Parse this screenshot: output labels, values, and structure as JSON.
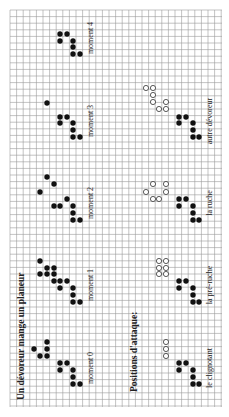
{
  "title": "Un dévoreur mange un planeur",
  "section2_title": "Positions d'attaque:",
  "grid": {
    "x0": 10,
    "y0": 10,
    "x1": 222,
    "y1": 407,
    "cell": 6.6,
    "line_color": "#9a9a9a"
  },
  "colors": {
    "filled": "#111111",
    "open_stroke": "#333333",
    "text": "#222222"
  },
  "moments": [
    {
      "label": "moment 0",
      "label_x": 93,
      "label_y": 368
    },
    {
      "label": "moment 1",
      "label_x": 93,
      "label_y": 285
    },
    {
      "label": "moment 2",
      "label_x": 93,
      "label_y": 203
    },
    {
      "label": "moment 3",
      "label_x": 93,
      "label_y": 121
    },
    {
      "label": "moment 4",
      "label_x": 93,
      "label_y": 38
    }
  ],
  "attacks": [
    {
      "label": "le clignotant",
      "label_x": 212,
      "label_y": 368
    },
    {
      "label": "la pré-ruche",
      "label_x": 212,
      "label_y": 285
    },
    {
      "label": "la ruche",
      "label_x": 212,
      "label_y": 203
    },
    {
      "label": "autre dévoreur",
      "label_x": 212,
      "label_y": 121
    }
  ],
  "filled_cells": [
    [
      47,
      342
    ],
    [
      34,
      349
    ],
    [
      47,
      349
    ],
    [
      40,
      356
    ],
    [
      47,
      356
    ],
    [
      60,
      363
    ],
    [
      67,
      363
    ],
    [
      60,
      370
    ],
    [
      73,
      370
    ],
    [
      73,
      377
    ],
    [
      73,
      384
    ],
    [
      80,
      384
    ],
    [
      40,
      261
    ],
    [
      47,
      268
    ],
    [
      54,
      268
    ],
    [
      40,
      274
    ],
    [
      47,
      274
    ],
    [
      54,
      274
    ],
    [
      54,
      281
    ],
    [
      60,
      281
    ],
    [
      67,
      281
    ],
    [
      60,
      288
    ],
    [
      73,
      288
    ],
    [
      73,
      295
    ],
    [
      73,
      302
    ],
    [
      80,
      302
    ],
    [
      47,
      177
    ],
    [
      54,
      184
    ],
    [
      40,
      192
    ],
    [
      67,
      199
    ],
    [
      54,
      206
    ],
    [
      60,
      206
    ],
    [
      73,
      206
    ],
    [
      73,
      213
    ],
    [
      73,
      220
    ],
    [
      80,
      220
    ],
    [
      47,
      103
    ],
    [
      60,
      117
    ],
    [
      67,
      117
    ],
    [
      60,
      123
    ],
    [
      73,
      123
    ],
    [
      73,
      130
    ],
    [
      73,
      137
    ],
    [
      80,
      137
    ],
    [
      60,
      34
    ],
    [
      67,
      34
    ],
    [
      60,
      41
    ],
    [
      73,
      41
    ],
    [
      73,
      47
    ],
    [
      73,
      54
    ],
    [
      80,
      54
    ],
    [
      179,
      117
    ],
    [
      186,
      117
    ],
    [
      179,
      123
    ],
    [
      193,
      123
    ],
    [
      193,
      130
    ],
    [
      193,
      137
    ],
    [
      199,
      137
    ],
    [
      179,
      199
    ],
    [
      186,
      199
    ],
    [
      179,
      206
    ],
    [
      193,
      206
    ],
    [
      193,
      213
    ],
    [
      193,
      220
    ],
    [
      199,
      220
    ],
    [
      179,
      281
    ],
    [
      186,
      281
    ],
    [
      179,
      288
    ],
    [
      193,
      288
    ],
    [
      193,
      295
    ],
    [
      193,
      302
    ],
    [
      199,
      302
    ],
    [
      179,
      363
    ],
    [
      186,
      363
    ],
    [
      179,
      370
    ],
    [
      193,
      370
    ],
    [
      193,
      377
    ],
    [
      193,
      384
    ],
    [
      199,
      384
    ]
  ],
  "open_cells": [
    [
      146,
      88
    ],
    [
      153,
      88
    ],
    [
      153,
      95
    ],
    [
      153,
      102
    ],
    [
      159,
      109
    ],
    [
      166,
      109
    ],
    [
      166,
      102
    ],
    [
      153,
      184
    ],
    [
      166,
      184
    ],
    [
      146,
      192
    ],
    [
      166,
      192
    ],
    [
      153,
      199
    ],
    [
      159,
      199
    ],
    [
      159,
      261
    ],
    [
      166,
      261
    ],
    [
      159,
      268
    ],
    [
      166,
      268
    ],
    [
      159,
      274
    ],
    [
      166,
      274
    ],
    [
      166,
      342
    ],
    [
      166,
      349
    ],
    [
      166,
      356
    ]
  ]
}
